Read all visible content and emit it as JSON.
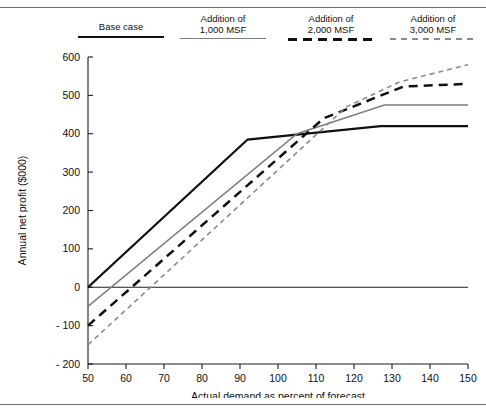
{
  "figure": {
    "top_rule": true,
    "bottom_rule": true,
    "clipped_header_text": ""
  },
  "legend": {
    "position": "top",
    "entries": [
      {
        "label_line1": "",
        "label_line2": "Base case",
        "style": "solid-black",
        "name": "base-case"
      },
      {
        "label_line1": "Addition of",
        "label_line2": "1,000 MSF",
        "style": "solid-gray",
        "name": "addition-1000-msf"
      },
      {
        "label_line1": "Addition of",
        "label_line2": "2,000 MSF",
        "style": "dash-black",
        "name": "addition-2000-msf"
      },
      {
        "label_line1": "Addition of",
        "label_line2": "3,000 MSF",
        "style": "dash-gray",
        "name": "addition-3000-msf"
      }
    ]
  },
  "chart_data": {
    "type": "line",
    "title": "",
    "xlabel": "Actual demand as percent of forecast",
    "ylabel": "Annual net profit ($000)",
    "xlim": [
      50,
      150
    ],
    "ylim": [
      -200,
      600
    ],
    "xticks": [
      50,
      60,
      70,
      80,
      90,
      100,
      110,
      120,
      130,
      140,
      150
    ],
    "yticks": [
      -200,
      -100,
      0,
      100,
      200,
      300,
      400,
      500,
      600
    ],
    "xtick_labels": [
      "50",
      "60",
      "70",
      "80",
      "90",
      "100",
      "110",
      "120",
      "130",
      "140",
      "150"
    ],
    "ytick_labels": [
      "- 200",
      "- 100",
      "0",
      "100",
      "200",
      "300",
      "400",
      "500",
      "600"
    ],
    "grid": false,
    "zero_reference_line": 0,
    "series": [
      {
        "name": "Base case",
        "style": "solid-black",
        "color": "#101010",
        "x": [
          50,
          92,
          127,
          150
        ],
        "y": [
          0,
          385,
          420,
          420
        ]
      },
      {
        "name": "Addition of 1,000 MSF",
        "style": "solid-gray",
        "color": "#7d7d7d",
        "x": [
          50,
          105,
          128,
          150
        ],
        "y": [
          -50,
          400,
          475,
          475
        ]
      },
      {
        "name": "Addition of 2,000 MSF",
        "style": "dash-black",
        "color": "#101010",
        "x": [
          50,
          112,
          133,
          150
        ],
        "y": [
          -100,
          440,
          523,
          530
        ]
      },
      {
        "name": "Addition of 3,000 MSF",
        "style": "dash-gray",
        "color": "#8a8a8a",
        "x": [
          50,
          118,
          132,
          150
        ],
        "y": [
          -150,
          470,
          535,
          580
        ]
      }
    ]
  }
}
